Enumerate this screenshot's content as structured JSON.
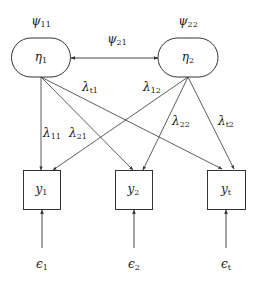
{
  "diagram": {
    "type": "structural-equation-model",
    "colors": {
      "stroke": "#333333",
      "background": "#ffffff",
      "text": "#222222"
    },
    "latent_nodes": [
      {
        "id": "eta1",
        "symbol": "η",
        "sub": "1",
        "x": 41,
        "y": 57,
        "w": 59,
        "h": 39
      },
      {
        "id": "eta2",
        "symbol": "η",
        "sub": "2",
        "x": 188,
        "y": 57,
        "w": 60,
        "h": 39
      }
    ],
    "observed_nodes": [
      {
        "id": "y1",
        "symbol": "y",
        "sub": "1",
        "x": 23,
        "y": 170,
        "w": 37,
        "h": 39
      },
      {
        "id": "y2",
        "symbol": "y",
        "sub": "2",
        "x": 115,
        "y": 170,
        "w": 37,
        "h": 39
      },
      {
        "id": "yt",
        "symbol": "y",
        "sub": "t",
        "x": 207,
        "y": 170,
        "w": 38,
        "h": 39
      }
    ],
    "variance_labels": [
      {
        "id": "psi11",
        "symbol": "ψ",
        "sub": "11",
        "x": 41,
        "y": 22
      },
      {
        "id": "psi22",
        "symbol": "ψ",
        "sub": "22",
        "x": 188,
        "y": 22
      }
    ],
    "covariance": {
      "id": "psi21",
      "symbol": "ψ",
      "sub": "21",
      "label_x": 117,
      "label_y": 40,
      "x1": 71,
      "x2": 158,
      "y": 58
    },
    "loadings": [
      {
        "id": "lambda11",
        "symbol": "λ",
        "sub": "11",
        "from": [
          41,
          77
        ],
        "to": [
          41,
          170
        ],
        "label_x": 52,
        "label_y": 134
      },
      {
        "id": "lambda21",
        "symbol": "λ",
        "sub": "21",
        "from": [
          41,
          77
        ],
        "to": [
          133,
          170
        ],
        "label_x": 78,
        "label_y": 134
      },
      {
        "id": "lambdat1",
        "symbol": "λ",
        "sub": "t1",
        "from": [
          41,
          77
        ],
        "to": [
          222,
          169
        ],
        "label_x": 90,
        "label_y": 88
      },
      {
        "id": "lambda12",
        "symbol": "λ",
        "sub": "12",
        "from": [
          188,
          77
        ],
        "to": [
          53,
          170
        ],
        "label_x": 152,
        "label_y": 88
      },
      {
        "id": "lambda22",
        "symbol": "λ",
        "sub": "22",
        "from": [
          188,
          77
        ],
        "to": [
          143,
          170
        ],
        "label_x": 181,
        "label_y": 122
      },
      {
        "id": "lambdat2",
        "symbol": "λ",
        "sub": "t2",
        "from": [
          188,
          77
        ],
        "to": [
          234,
          169
        ],
        "label_x": 226,
        "label_y": 122
      }
    ],
    "errors": [
      {
        "id": "eps1",
        "symbol": "ϵ",
        "sub": "1",
        "x": 42,
        "from_y": 248,
        "to_y": 210,
        "label_y": 265
      },
      {
        "id": "eps2",
        "symbol": "ϵ",
        "sub": "2",
        "x": 134,
        "from_y": 248,
        "to_y": 210,
        "label_y": 265
      },
      {
        "id": "epst",
        "symbol": "ϵ",
        "sub": "t",
        "x": 226,
        "from_y": 248,
        "to_y": 210,
        "label_y": 265
      }
    ]
  }
}
